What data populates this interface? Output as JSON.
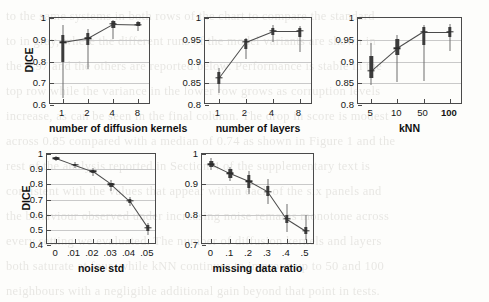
{
  "figure": {
    "background_note": "scanned journal page, faint bleed-through text behind plots",
    "axis_color": "#4a4a4a",
    "grid_color": "#c9c9c9",
    "marker_color": "#3b3b3b",
    "line_color": "#4a4a4a"
  },
  "bleed_text": [
    "to the same systems in both rows of the chart to compare the standard",
    "to in gray, where the different runs of the model variants are shown in",
    "the 0.97 and the others are reported below. Performance is stable in the",
    "top row while the variance in the lower row grows as corruption levels",
    "increase, as can be seen in the final column. The drop in score is modest",
    "across 0.85 compared with a median of 0.74 as shown in Figure 1 and the",
    "rest of the analysis reported in Section 4 of the supplementary text is",
    "consistent with the values that appear within each of the six panels and",
    "the behaviour observed under increasing noise remains monotone across",
    "every setting we evaluated. The number of diffusion kernels and layers",
    "both saturate at four, while kNN continues to improve up to 50 and 100",
    "neighbours with a negligible additional gain beyond that point in tests."
  ],
  "chart_data": [
    {
      "id": "diffusion-kernels",
      "type": "line",
      "title": "",
      "xlabel": "number of diffusion kernels",
      "ylabel": "DICE",
      "categories": [
        "1",
        "2",
        "4",
        "8"
      ],
      "values": [
        0.888,
        0.907,
        0.972,
        0.97
      ],
      "box_low": [
        0.797,
        0.876,
        0.955,
        0.962
      ],
      "box_high": [
        0.922,
        0.932,
        0.984,
        0.98
      ],
      "whisker_low": [
        0.632,
        0.766,
        0.905,
        0.942
      ],
      "whisker_high": [
        0.966,
        0.95,
        0.993,
        0.988
      ],
      "ylim": [
        0.6,
        1.0
      ],
      "yticks": [
        "0.6",
        "0.7",
        "0.8",
        "0.9",
        "1"
      ],
      "ytickvals": [
        0.6,
        0.7,
        0.8,
        0.9,
        1.0
      ],
      "grid": true,
      "legend": "none"
    },
    {
      "id": "layers",
      "type": "line",
      "title": "",
      "xlabel": "number of layers",
      "ylabel": "",
      "categories": [
        "1",
        "2",
        "4",
        "8"
      ],
      "values": [
        0.862,
        0.945,
        0.97,
        0.97
      ],
      "box_low": [
        0.848,
        0.929,
        0.96,
        0.956
      ],
      "box_high": [
        0.875,
        0.951,
        0.978,
        0.977
      ],
      "whisker_low": [
        0.828,
        0.906,
        0.944,
        0.922
      ],
      "whisker_high": [
        0.884,
        0.955,
        0.985,
        0.982
      ],
      "ylim": [
        0.8,
        1.0
      ],
      "yticks": [
        "0.8",
        "0.85",
        "0.9",
        "0.95",
        "1"
      ],
      "ytickvals": [
        0.8,
        0.85,
        0.9,
        0.95,
        1.0
      ],
      "grid": true,
      "legend": "none"
    },
    {
      "id": "knn",
      "type": "line",
      "title": "",
      "xlabel": "kNN",
      "ylabel": "",
      "categories": [
        "5",
        "10",
        "50",
        "100"
      ],
      "categories_bold": [
        "100"
      ],
      "values": [
        0.878,
        0.93,
        0.968,
        0.968
      ],
      "box_low": [
        0.862,
        0.914,
        0.938,
        0.956
      ],
      "box_high": [
        0.912,
        0.951,
        0.979,
        0.98
      ],
      "whisker_low": [
        0.845,
        0.852,
        0.856,
        0.925
      ],
      "whisker_high": [
        0.943,
        0.962,
        0.984,
        0.987
      ],
      "ylim": [
        0.8,
        1.0
      ],
      "yticks": [
        "0.8",
        "0.85",
        "0.9",
        "0.95",
        "1"
      ],
      "ytickvals": [
        0.8,
        0.85,
        0.9,
        0.95,
        1.0
      ],
      "grid": true,
      "legend": "none"
    },
    {
      "id": "noise-std",
      "type": "line",
      "title": "",
      "xlabel": "noise std",
      "ylabel": "DICE",
      "categories": [
        "0",
        ".01",
        ".02",
        ".03",
        ".04",
        ".05"
      ],
      "values": [
        0.972,
        0.928,
        0.885,
        0.8,
        0.69,
        0.512
      ],
      "box_low": [
        0.963,
        0.918,
        0.873,
        0.784,
        0.676,
        0.492
      ],
      "box_high": [
        0.98,
        0.937,
        0.896,
        0.812,
        0.702,
        0.53
      ],
      "whisker_low": [
        0.952,
        0.905,
        0.858,
        0.757,
        0.656,
        0.468
      ],
      "whisker_high": [
        0.988,
        0.946,
        0.906,
        0.828,
        0.716,
        0.545
      ],
      "ylim": [
        0.4,
        1.0
      ],
      "yticks": [
        "0.4",
        "0.5",
        "0.6",
        "0.7",
        "0.8",
        "0.9",
        "1"
      ],
      "ytickvals": [
        0.4,
        0.5,
        0.6,
        0.7,
        0.8,
        0.9,
        1.0
      ],
      "grid": true,
      "legend": "none"
    },
    {
      "id": "missing-data-ratio",
      "type": "line",
      "title": "",
      "xlabel": "missing data ratio",
      "ylabel": "",
      "categories": [
        "0",
        ".1",
        ".2",
        ".3",
        ".4",
        ".5"
      ],
      "values": [
        0.966,
        0.936,
        0.91,
        0.876,
        0.786,
        0.747
      ],
      "box_low": [
        0.957,
        0.922,
        0.888,
        0.86,
        0.772,
        0.737
      ],
      "box_high": [
        0.977,
        0.95,
        0.93,
        0.894,
        0.8,
        0.76
      ],
      "whisker_low": [
        0.946,
        0.912,
        0.868,
        0.836,
        0.742,
        0.718
      ],
      "whisker_high": [
        0.986,
        0.958,
        0.944,
        0.916,
        0.836,
        0.8
      ],
      "ylim": [
        0.7,
        1.0
      ],
      "yticks": [
        "0.7",
        "0.8",
        "0.9",
        "1"
      ],
      "ytickvals": [
        0.7,
        0.8,
        0.9,
        1.0
      ],
      "grid": true,
      "legend": "none"
    },
    {
      "id": "outlier-ratio",
      "type": "line",
      "title": "",
      "xlabel": "outlier ratio",
      "ylabel": "",
      "categories": [
        "0",
        ".1",
        ".2",
        ".3",
        ".4",
        ".5"
      ],
      "values": [
        0.968,
        0.852,
        0.855,
        0.864,
        0.838,
        0.81
      ],
      "box_low": [
        0.958,
        0.838,
        0.832,
        0.848,
        0.826,
        0.796
      ],
      "box_high": [
        0.98,
        0.866,
        0.872,
        0.88,
        0.854,
        0.828
      ],
      "whisker_low": [
        0.944,
        0.796,
        0.776,
        0.8,
        0.802,
        0.742
      ],
      "whisker_high": [
        0.988,
        0.884,
        0.886,
        0.896,
        0.878,
        0.86
      ]
    }
  ]
}
